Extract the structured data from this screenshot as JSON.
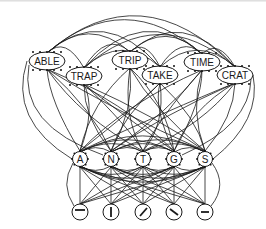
{
  "diagram": {
    "type": "interactive-activation-network",
    "levels": [
      "word",
      "letter",
      "feature"
    ],
    "word_nodes": [
      {
        "label": "ABLE",
        "x": 47,
        "y": 61
      },
      {
        "label": "TRAP",
        "x": 84,
        "y": 76
      },
      {
        "label": "TRIP",
        "x": 130,
        "y": 60
      },
      {
        "label": "TAKE",
        "x": 160,
        "y": 75
      },
      {
        "label": "TIME",
        "x": 202,
        "y": 62
      },
      {
        "label": "CRAT",
        "x": 235,
        "y": 75
      }
    ],
    "letter_nodes": [
      {
        "label": "A",
        "x": 80,
        "y": 159
      },
      {
        "label": "N",
        "x": 111,
        "y": 159
      },
      {
        "label": "T",
        "x": 143,
        "y": 159
      },
      {
        "label": "G",
        "x": 174,
        "y": 159
      },
      {
        "label": "S",
        "x": 205,
        "y": 159
      }
    ],
    "feature_nodes": [
      {
        "glyph": "horizontal-bar-top",
        "x": 80,
        "y": 212
      },
      {
        "glyph": "vertical-bar",
        "x": 111,
        "y": 212
      },
      {
        "glyph": "diagonal-right",
        "x": 143,
        "y": 212
      },
      {
        "glyph": "diagonal-left",
        "x": 174,
        "y": 212
      },
      {
        "glyph": "horizontal-bar-middle",
        "x": 205,
        "y": 212
      }
    ],
    "colors": {
      "stroke": "#1a1a1a",
      "background": "#ffffff"
    }
  }
}
